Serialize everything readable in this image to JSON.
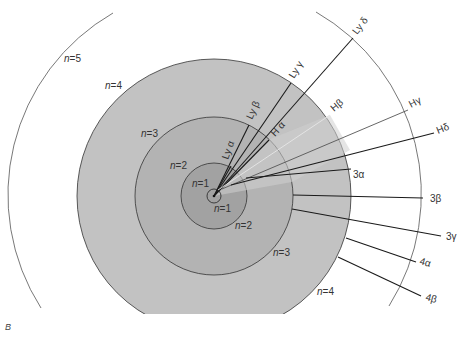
{
  "figure": {
    "panel_label": "B",
    "colors": {
      "background": "#ffffff",
      "disc_n4": "#c2c2c2",
      "disc_n3": "#b4b4b4",
      "disc_n2": "#a3a3a3",
      "disc_n1": "#b8b8b8",
      "outline": "#333333",
      "transition_line": "#1a1a1a",
      "light_line": "#e0e0e0"
    },
    "shells": [
      {
        "name": "n=1",
        "var": "n",
        "value": "1"
      },
      {
        "name": "n=2",
        "var": "n",
        "value": "2"
      },
      {
        "name": "n=3",
        "var": "n",
        "value": "3"
      },
      {
        "name": "n=4",
        "var": "n",
        "value": "4"
      },
      {
        "name": "n=5",
        "var": "n",
        "value": "5"
      }
    ],
    "shell_labels": [
      {
        "id": "n1-inner",
        "text_var": "n",
        "text_val": "=1"
      },
      {
        "id": "n1-outer",
        "text_var": "n",
        "text_val": "=1"
      },
      {
        "id": "n2-left",
        "text_var": "n",
        "text_val": "=2"
      },
      {
        "id": "n2-right",
        "text_var": "n",
        "text_val": "=2"
      },
      {
        "id": "n3-left",
        "text_var": "n",
        "text_val": "=3"
      },
      {
        "id": "n3-right",
        "text_var": "n",
        "text_val": "=3"
      },
      {
        "id": "n4-left",
        "text_var": "n",
        "text_val": "=4"
      },
      {
        "id": "n4-right",
        "text_var": "n",
        "text_val": "=4"
      },
      {
        "id": "n5-left",
        "text_var": "n",
        "text_val": "=5"
      }
    ],
    "transitions": [
      {
        "series": "Lyman",
        "label": "Ly α",
        "from": 2,
        "to": 1
      },
      {
        "series": "Lyman",
        "label": "Ly β",
        "from": 3,
        "to": 1
      },
      {
        "series": "Lyman",
        "label": "Ly γ",
        "from": 4,
        "to": 1
      },
      {
        "series": "Lyman",
        "label": "Ly δ",
        "from": 5,
        "to": 1
      },
      {
        "series": "Balmer",
        "label": "H α",
        "from": 3,
        "to": 2
      },
      {
        "series": "Balmer",
        "label": "Hβ",
        "from": 4,
        "to": 2
      },
      {
        "series": "Balmer",
        "label": "Hγ",
        "from": 5,
        "to": 2
      },
      {
        "series": "Balmer",
        "label": "Hδ",
        "from": 6,
        "to": 2
      },
      {
        "series": "Paschen",
        "label": "3α",
        "from": 4,
        "to": 3
      },
      {
        "series": "Paschen",
        "label": "3β",
        "from": 5,
        "to": 3
      },
      {
        "series": "Paschen",
        "label": "3γ",
        "from": 6,
        "to": 3
      },
      {
        "series": "Brackett",
        "label": "4α",
        "from": 5,
        "to": 4
      },
      {
        "series": "Brackett",
        "label": "4β",
        "from": 6,
        "to": 4
      }
    ]
  }
}
